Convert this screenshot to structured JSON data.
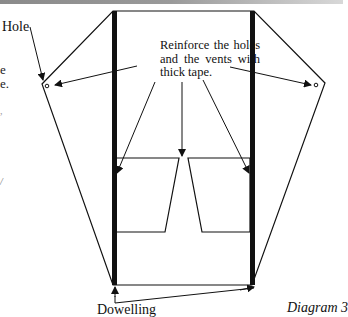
{
  "diagram": {
    "labels": {
      "hole": "Hole",
      "instruction": "Reinforce the holes and the vents with thick tape.",
      "dowelling": "Dowelling",
      "caption": "Diagram 3"
    },
    "left_edge_fragments": [
      "e",
      "e.",
      ",",
      "/"
    ],
    "colors": {
      "line": "#111111",
      "dowel": "#111111",
      "background": "#ffffff"
    },
    "shapes": {
      "kite_outline": "113,11 254,11 325,83 252,285 113,285 42,84",
      "left_dowel": {
        "x": 112,
        "y1": 11,
        "y2": 285,
        "width": 5
      },
      "right_dowel": {
        "x": 250,
        "y1": 11,
        "y2": 285,
        "width": 5
      },
      "left_vent": "116,158 179,158 165,232 116,232",
      "right_vent": "188,158 250,158 250,232 202,232",
      "holes": [
        {
          "cx": 47,
          "cy": 86
        },
        {
          "cx": 316,
          "cy": 85
        }
      ]
    }
  }
}
